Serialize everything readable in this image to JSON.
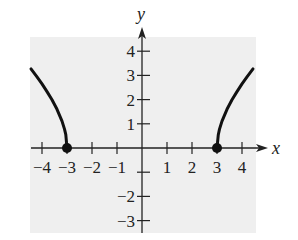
{
  "chart_data": {
    "type": "line",
    "title": "",
    "function": "y = sqrt(x^2 - 9)",
    "xlabel": "x",
    "ylabel": "y",
    "xlim": [
      -4.44,
      4.44
    ],
    "ylim": [
      -3.5,
      4.5
    ],
    "x_ticks": [
      -4,
      -3,
      -2,
      -1,
      1,
      2,
      3,
      4
    ],
    "x_tick_labels": [
      "−4",
      "−3",
      "−2",
      "−1",
      "1",
      "2",
      "3",
      "4"
    ],
    "y_ticks": [
      -3,
      -2,
      -1,
      1,
      2,
      3,
      4
    ],
    "y_tick_labels": [
      "−3",
      "−2",
      "",
      "1",
      "2",
      "3",
      "4"
    ],
    "grid": false,
    "background": "#efefef",
    "series": [
      {
        "name": "left branch",
        "x": [
          -4.44,
          -4.2,
          -4.0,
          -3.8,
          -3.6,
          -3.4,
          -3.2,
          -3.1,
          -3.05,
          -3.0
        ],
        "y": [
          3.27,
          2.94,
          2.65,
          2.33,
          1.99,
          1.6,
          1.11,
          0.78,
          0.55,
          0.0
        ]
      },
      {
        "name": "right branch",
        "x": [
          3.0,
          3.05,
          3.1,
          3.2,
          3.4,
          3.6,
          3.8,
          4.0,
          4.2,
          4.44
        ],
        "y": [
          0.0,
          0.55,
          0.78,
          1.11,
          1.6,
          1.99,
          2.33,
          2.65,
          2.94,
          3.27
        ]
      }
    ],
    "points": [
      {
        "x": -3,
        "y": 0,
        "style": "filled"
      },
      {
        "x": 3,
        "y": 0,
        "style": "filled"
      }
    ]
  }
}
